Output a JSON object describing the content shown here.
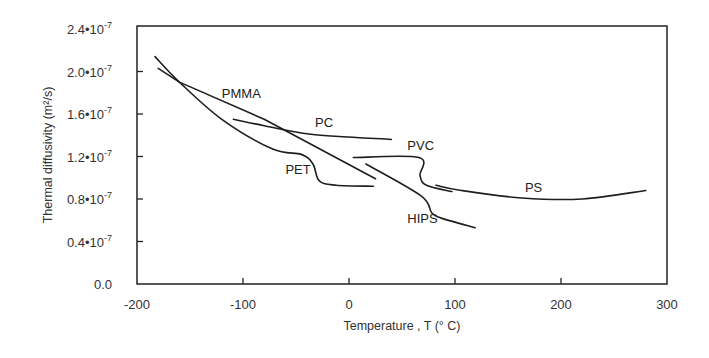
{
  "chart_data": {
    "type": "line",
    "title": "",
    "xlabel": "Temperature , T  (° C)",
    "ylabel": "Thermal diffusivity  (m²/s)",
    "xlim": [
      -200,
      300
    ],
    "ylim": [
      0.0,
      2.4
    ],
    "y_unit_multiplier": "1e-7",
    "grid": false,
    "legend": "inline labels",
    "x_ticks": [
      -200,
      -100,
      0,
      100,
      200,
      300
    ],
    "x_tick_labels": [
      "-200",
      "-100",
      "0",
      "100",
      "200",
      "300"
    ],
    "y_ticks": [
      0.0,
      0.4,
      0.8,
      1.2,
      1.6,
      2.0,
      2.4
    ],
    "y_tick_labels": [
      "0.0",
      "0.4•10⁻⁷",
      "0.8•10⁻⁷",
      "1.2•10⁻⁷",
      "1.6•10⁻⁷",
      "2.0•10⁻⁷",
      "2.4•10⁻⁷"
    ],
    "series": [
      {
        "name": "PMMA",
        "label_pos": [
          -120,
          1.75
        ],
        "x": [
          -180,
          -160,
          -80,
          25
        ],
        "y": [
          2.03,
          1.9,
          1.55,
          0.99
        ]
      },
      {
        "name": "PET",
        "label_pos": [
          -60,
          1.04
        ],
        "x": [
          -183,
          -160,
          -120,
          -72,
          -45,
          -34,
          -28,
          -12,
          23
        ],
        "y": [
          2.14,
          1.9,
          1.55,
          1.27,
          1.22,
          1.13,
          0.97,
          0.93,
          0.92
        ]
      },
      {
        "name": "PC",
        "label_pos": [
          -32,
          1.48
        ],
        "x": [
          -109,
          -80,
          -36,
          40
        ],
        "y": [
          1.55,
          1.49,
          1.41,
          1.36
        ]
      },
      {
        "name": "PVC",
        "label_pos": [
          55,
          1.26
        ],
        "x": [
          4,
          66,
          67,
          73,
          97
        ],
        "y": [
          1.19,
          1.19,
          1.02,
          0.93,
          0.87
        ]
      },
      {
        "name": "HIPS",
        "label_pos": [
          55,
          0.57
        ],
        "x": [
          16,
          68,
          78,
          87,
          119
        ],
        "y": [
          1.13,
          0.83,
          0.67,
          0.62,
          0.53
        ]
      },
      {
        "name": "PS",
        "label_pos": [
          166,
          0.87
        ],
        "x": [
          82,
          106,
          163,
          220,
          280
        ],
        "y": [
          0.93,
          0.88,
          0.81,
          0.8,
          0.88
        ]
      }
    ]
  }
}
